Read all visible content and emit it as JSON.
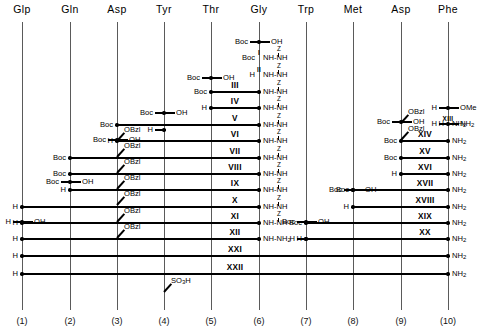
{
  "figure": {
    "type": "peptide-synthesis-scheme",
    "title": "",
    "width": 479,
    "height": 335,
    "line_color": "#000000",
    "column_color": "#5a5a5a"
  },
  "columns": [
    {
      "index": 1,
      "residue": "Glp",
      "number": "(1)",
      "x": 22
    },
    {
      "index": 2,
      "residue": "Gln",
      "number": "(2)",
      "x": 70
    },
    {
      "index": 3,
      "residue": "Asp",
      "number": "(3)",
      "x": 117
    },
    {
      "index": 4,
      "residue": "Tyr",
      "number": "(4)",
      "x": 164
    },
    {
      "index": 5,
      "residue": "Thr",
      "number": "(5)",
      "x": 211
    },
    {
      "index": 6,
      "residue": "Gly",
      "number": "(6)",
      "x": 259
    },
    {
      "index": 7,
      "residue": "Trp",
      "number": "(7)",
      "x": 306
    },
    {
      "index": 8,
      "residue": "Met",
      "number": "(8)",
      "x": 353
    },
    {
      "index": 9,
      "residue": "Asp",
      "number": "(9)",
      "x": 401
    },
    {
      "index": 10,
      "residue": "Phe",
      "number": "(10)",
      "x": 448
    }
  ],
  "side_chains": [
    {
      "name": "OBzl-asp3-1",
      "label": "OBzl",
      "column": 3,
      "y": 140
    },
    {
      "name": "OBzl-asp3-2",
      "label": "OBzl",
      "column": 3,
      "y": 156
    },
    {
      "name": "OBzl-asp3-3",
      "label": "OBzl",
      "column": 3,
      "y": 172
    },
    {
      "name": "OBzl-asp3-4",
      "label": "OBzl",
      "column": 3,
      "y": 188
    },
    {
      "name": "OBzl-asp3-5",
      "label": "OBzl",
      "column": 3,
      "y": 204
    },
    {
      "name": "OBzl-asp3-6",
      "label": "OBzl",
      "column": 3,
      "y": 221
    },
    {
      "name": "OBzl-asp3-7",
      "label": "OBzl",
      "column": 3,
      "y": 237
    },
    {
      "name": "SO3H-tyr4",
      "label": "SO3H",
      "column": 4,
      "y": 291
    },
    {
      "name": "OBzl-asp9-1",
      "label": "OBzl",
      "column": 9,
      "y": 122
    },
    {
      "name": "OBzl-asp9-2",
      "label": "OBzl",
      "column": 9,
      "y": 139
    }
  ],
  "protecting_groups": {
    "boc": "Boc",
    "h": "H",
    "oh": "OH",
    "obzl": "OBzl",
    "ome": "OMe",
    "z": "Z",
    "nh": "NH",
    "nh2": "NH2",
    "nh_nh": "NH-NH",
    "nh_nh2": "NH-NH2",
    "so3h": "SO3H"
  },
  "rows": [
    {
      "roman": "I",
      "y": 58,
      "size": "small",
      "roman_x": 259,
      "left": {
        "text": "Boc",
        "column": 6
      },
      "right": {
        "text": "NH-NH",
        "column": 6,
        "z": true
      },
      "segments": []
    },
    {
      "roman": "II",
      "y": 75,
      "size": "small",
      "roman_x": 259,
      "left": {
        "text": "H",
        "column": 6
      },
      "right": {
        "text": "NH-NH",
        "column": 6,
        "z": true
      },
      "segments": []
    },
    {
      "roman": "III",
      "y": 92,
      "size": "normal",
      "roman_x": 235,
      "left": {
        "text": "Boc",
        "column": 5
      },
      "right": {
        "text": "NH-NH",
        "column": 6,
        "z": true
      },
      "segments": [
        [
          5,
          6
        ]
      ]
    },
    {
      "roman": "IV",
      "y": 108,
      "size": "normal",
      "roman_x": 235,
      "left": {
        "text": "H",
        "column": 5
      },
      "right": {
        "text": "NH-NH",
        "column": 6,
        "z": true
      },
      "segments": [
        [
          5,
          6
        ]
      ]
    },
    {
      "roman": "V",
      "y": 125,
      "size": "normal",
      "roman_x": 235,
      "left": {
        "text": "Boc",
        "column": 3
      },
      "right": {
        "text": "NH-NH",
        "column": 6,
        "z": true
      },
      "segments": [
        [
          3,
          6
        ]
      ]
    },
    {
      "roman": "VI",
      "y": 141,
      "size": "normal",
      "roman_x": 235,
      "left": {
        "text": "H",
        "column": 3
      },
      "right": {
        "text": "NH-NH",
        "column": 6,
        "z": true
      },
      "segments": [
        [
          3,
          6
        ]
      ]
    },
    {
      "roman": "VII",
      "y": 158,
      "size": "normal",
      "roman_x": 235,
      "left": {
        "text": "Boc",
        "column": 2
      },
      "right": {
        "text": "NH-NH",
        "column": 6,
        "z": true
      },
      "segments": [
        [
          2,
          6
        ]
      ]
    },
    {
      "roman": "VIII",
      "y": 174,
      "size": "normal",
      "roman_x": 235,
      "left": {
        "text": "Boc",
        "column": 2
      },
      "right": {
        "text": "NH-NH",
        "column": 6,
        "z": true
      },
      "segments": [
        [
          2,
          6
        ]
      ]
    },
    {
      "roman": "IX",
      "y": 190,
      "size": "normal",
      "roman_x": 235,
      "left": {
        "text": "H",
        "column": 2
      },
      "right": {
        "text": "NH-NH",
        "column": 6,
        "z": true
      },
      "segments": [
        [
          2,
          6
        ]
      ]
    },
    {
      "roman": "X",
      "y": 207,
      "size": "normal",
      "roman_x": 235,
      "left": {
        "text": "H",
        "column": 1
      },
      "right": {
        "text": "NH-NH",
        "column": 6,
        "z": true
      },
      "segments": [
        [
          1,
          6
        ]
      ]
    },
    {
      "roman": "XI",
      "y": 223,
      "size": "normal",
      "roman_x": 235,
      "left": {
        "text": "H",
        "column": 1
      },
      "right": {
        "text": "NH-NH",
        "column": 6,
        "z": true
      },
      "segments": [
        [
          1,
          6
        ]
      ]
    },
    {
      "roman": "XII",
      "y": 239,
      "size": "normal",
      "roman_x": 235,
      "left": {
        "text": "H",
        "column": 1
      },
      "right": {
        "text": "NH-NH2",
        "column": 6,
        "z": false
      },
      "segments": [
        [
          1,
          6
        ]
      ]
    },
    {
      "roman": "XXI",
      "y": 256,
      "size": "normal",
      "roman_x": 235,
      "left": {
        "text": "H",
        "column": 1
      },
      "right": {
        "text": "NH2",
        "column": 10,
        "z": false
      },
      "segments": [
        [
          1,
          10
        ]
      ]
    },
    {
      "roman": "XXII",
      "y": 274,
      "size": "normal",
      "roman_x": 235,
      "left": {
        "text": "H",
        "column": 1
      },
      "right": {
        "text": "NH2",
        "column": 10,
        "z": false
      },
      "segments": [
        [
          1,
          10
        ]
      ]
    },
    {
      "roman": "XIII",
      "y": 124,
      "size": "small",
      "roman_x": 448,
      "left": {
        "text": "H",
        "column": 10
      },
      "right": {
        "text": "NH2",
        "column": 10,
        "z": false
      },
      "segments": []
    },
    {
      "roman": "XIV",
      "y": 141,
      "size": "normal",
      "roman_x": 425,
      "left": {
        "text": "Boc",
        "column": 9
      },
      "right": {
        "text": "NH2",
        "column": 10,
        "z": false
      },
      "segments": [
        [
          9,
          10
        ]
      ]
    },
    {
      "roman": "XV",
      "y": 158,
      "size": "normal",
      "roman_x": 425,
      "left": {
        "text": "Boc",
        "column": 9
      },
      "right": {
        "text": "NH2",
        "column": 10,
        "z": false
      },
      "segments": [
        [
          9,
          10
        ]
      ]
    },
    {
      "roman": "XVI",
      "y": 174,
      "size": "normal",
      "roman_x": 425,
      "left": {
        "text": "H",
        "column": 9
      },
      "right": {
        "text": "NH2",
        "column": 10,
        "z": false
      },
      "segments": [
        [
          9,
          10
        ]
      ]
    },
    {
      "roman": "XVII",
      "y": 190,
      "size": "normal",
      "roman_x": 425,
      "left": {
        "text": "Boc",
        "column": 8
      },
      "right": {
        "text": "NH2",
        "column": 10,
        "z": false
      },
      "segments": [
        [
          8,
          10
        ]
      ]
    },
    {
      "roman": "XVIII",
      "y": 207,
      "size": "normal",
      "roman_x": 425,
      "left": {
        "text": "H",
        "column": 8
      },
      "right": {
        "text": "NH2",
        "column": 10,
        "z": false
      },
      "segments": [
        [
          8,
          10
        ]
      ]
    },
    {
      "roman": "XIX",
      "y": 223,
      "size": "normal",
      "roman_x": 425,
      "left": {
        "text": "Boc",
        "column": 7
      },
      "right": {
        "text": "NH2",
        "column": 10,
        "z": false
      },
      "segments": [
        [
          7,
          10
        ]
      ]
    },
    {
      "roman": "XX",
      "y": 239,
      "size": "normal",
      "roman_x": 425,
      "left": {
        "text": "H",
        "column": 7
      },
      "right": {
        "text": "NH2",
        "column": 10,
        "z": false
      },
      "segments": [
        [
          7,
          10
        ]
      ]
    }
  ],
  "stubs": [
    {
      "name": "boc-oh-thr5",
      "y": 78,
      "column": 5,
      "left": "Boc",
      "right": "OH"
    },
    {
      "name": "boc-oh-gly6",
      "y": 42,
      "column": 6,
      "left": "Boc",
      "right": "OH"
    },
    {
      "name": "boc-oh-tyr4",
      "y": 113,
      "column": 4,
      "left": "Boc",
      "right": "OH"
    },
    {
      "name": "h-tyr4",
      "y": 130,
      "column": 4,
      "left": "H",
      "right": ""
    },
    {
      "name": "boc-oh-asp3",
      "y": 140,
      "column": 3,
      "left": "Boc",
      "right": "OH"
    },
    {
      "name": "boc-oh-gln2",
      "y": 182,
      "column": 2,
      "left": "Boc",
      "right": "OH"
    },
    {
      "name": "h-oh-glp1",
      "y": 222,
      "column": 1,
      "left": "H",
      "right": "OH"
    },
    {
      "name": "boc-oh-trp7",
      "y": 222,
      "column": 7,
      "left": "Boc",
      "right": "OH"
    },
    {
      "name": "h-trp7",
      "y": 239,
      "column": 7,
      "left": "H",
      "right": ""
    },
    {
      "name": "boc-oh-met8",
      "y": 190,
      "column": 8,
      "left": "Boc",
      "right": "OH"
    },
    {
      "name": "boc-oh-asp9",
      "y": 122,
      "column": 9,
      "left": "Boc",
      "right": "OH"
    },
    {
      "name": "h-ome-phe10",
      "y": 108,
      "column": 10,
      "left": "H",
      "right": "OMe"
    },
    {
      "name": "h-nh2-phe10",
      "y": 124,
      "column": 10,
      "left": "H",
      "right": "NH2"
    }
  ]
}
